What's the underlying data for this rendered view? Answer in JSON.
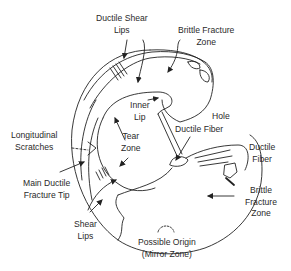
{
  "diagram": {
    "type": "fracture-surface-annotation",
    "line_color": "#222222",
    "background": "#ffffff",
    "labels": [
      {
        "id": "ductile-shear-lips",
        "lines": [
          "Ductile Shear",
          "Lips"
        ]
      },
      {
        "id": "brittle-fracture-zone-top",
        "lines": [
          "Brittle Fracture",
          "Zone"
        ]
      },
      {
        "id": "inner-lip",
        "lines": [
          "Inner",
          "Lip"
        ]
      },
      {
        "id": "hole",
        "lines": [
          "Hole"
        ]
      },
      {
        "id": "ductile-fiber-center",
        "lines": [
          "Ductile Fiber"
        ]
      },
      {
        "id": "longitudinal-scratches",
        "lines": [
          "Longitudinal",
          "Scratches"
        ]
      },
      {
        "id": "tear-zone",
        "lines": [
          "Tear",
          "Zone"
        ]
      },
      {
        "id": "ductile-fiber-right",
        "lines": [
          "Ductile",
          "Fiber"
        ]
      },
      {
        "id": "main-ductile-fracture-tip",
        "lines": [
          "Main Ductile",
          "Fracture Tip"
        ]
      },
      {
        "id": "brittle-fracture-zone-right",
        "lines": [
          "Brittle",
          "Fracture",
          "Zone"
        ]
      },
      {
        "id": "shear-lips",
        "lines": [
          "Shear",
          "Lips"
        ]
      },
      {
        "id": "possible-origin",
        "lines": [
          "Possible Origin",
          "(Mirror Zone)"
        ]
      }
    ]
  }
}
